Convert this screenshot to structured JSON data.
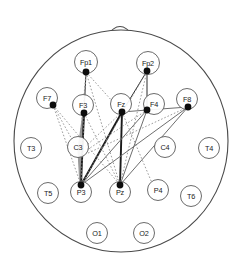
{
  "figure": {
    "view": "top-down head map with nose marker at top",
    "background_color": "#ffffff",
    "head": {
      "center_x": 121,
      "center_y": 141,
      "radius_x": 107,
      "radius_y": 111,
      "outline_color": "#4a4a4a"
    },
    "nose": {
      "name": "nose-marker",
      "apex_x": 120,
      "apex_y": 20,
      "base_left_x": 107,
      "base_left_y": 36,
      "base_right_x": 133,
      "base_right_y": 36
    }
  },
  "colors": {
    "outline": "#4a4a4a",
    "node_ring": "#5a5a5a",
    "node_dot": "#0d0d0d",
    "edge_strong": "#1a1a1a",
    "edge_medium": "#6e6e6e",
    "edge_weak": "#8a8a8a",
    "band": "#9a9a9a"
  },
  "electrodes": [
    {
      "id": "Fp1",
      "label": "Fp1",
      "x": 86,
      "y": 62,
      "r": 11.5,
      "active": true,
      "dot_x": 86,
      "dot_y": 72
    },
    {
      "id": "Fp2",
      "label": "Fp2",
      "x": 148,
      "y": 63,
      "r": 11.5,
      "active": true,
      "dot_x": 147,
      "dot_y": 71
    },
    {
      "id": "F7",
      "label": "F7",
      "x": 47,
      "y": 98,
      "r": 10.5,
      "active": true,
      "dot_x": 53,
      "dot_y": 105
    },
    {
      "id": "F3",
      "label": "F3",
      "x": 83,
      "y": 105,
      "r": 10.5,
      "active": true,
      "dot_x": 84,
      "dot_y": 113
    },
    {
      "id": "Fz",
      "label": "Fz",
      "x": 121,
      "y": 104,
      "r": 10.5,
      "active": true,
      "dot_x": 122,
      "dot_y": 112
    },
    {
      "id": "F4",
      "label": "F4",
      "x": 154,
      "y": 104,
      "r": 10.5,
      "active": true,
      "dot_x": 147,
      "dot_y": 110
    },
    {
      "id": "F8",
      "label": "F8",
      "x": 187,
      "y": 99,
      "r": 10.5,
      "active": true,
      "dot_x": 188,
      "dot_y": 107
    },
    {
      "id": "T3",
      "label": "T3",
      "x": 31,
      "y": 148,
      "r": 10.5,
      "active": false
    },
    {
      "id": "C3",
      "label": "C3",
      "x": 78,
      "y": 147,
      "r": 10.5,
      "active": false
    },
    {
      "id": "C4",
      "label": "C4",
      "x": 165,
      "y": 147,
      "r": 10.5,
      "active": false
    },
    {
      "id": "T4",
      "label": "T4",
      "x": 209,
      "y": 148,
      "r": 10.5,
      "active": false
    },
    {
      "id": "T5",
      "label": "T5",
      "x": 48,
      "y": 193,
      "r": 10.5,
      "active": false
    },
    {
      "id": "P3",
      "label": "P3",
      "x": 81,
      "y": 192,
      "r": 10.5,
      "active": true,
      "dot_x": 81,
      "dot_y": 185
    },
    {
      "id": "Pz",
      "label": "Pz",
      "x": 120,
      "y": 192,
      "r": 10.5,
      "active": true,
      "dot_x": 120,
      "dot_y": 185
    },
    {
      "id": "P4",
      "label": "P4",
      "x": 158,
      "y": 190,
      "r": 10.5,
      "active": false
    },
    {
      "id": "T6",
      "label": "T6",
      "x": 191,
      "y": 196,
      "r": 10.5,
      "active": false
    },
    {
      "id": "O1",
      "label": "O1",
      "x": 97,
      "y": 233,
      "r": 10.5,
      "active": false
    },
    {
      "id": "O2",
      "label": "O2",
      "x": 144,
      "y": 233,
      "r": 10.5,
      "active": false
    }
  ],
  "connections": [
    {
      "from": "F3",
      "to": "C3",
      "style": "band",
      "x1": 84,
      "y1": 113,
      "x2": 79,
      "y2": 150
    },
    {
      "from": "C3",
      "to": "P3",
      "style": "band",
      "x1": 79,
      "y1": 150,
      "x2": 81,
      "y2": 185
    },
    {
      "from": "F3",
      "to": "P3",
      "style": "solid-thick",
      "x1": 84,
      "y1": 113,
      "x2": 81,
      "y2": 185
    },
    {
      "from": "Fz",
      "to": "Pz",
      "style": "solid-thick",
      "x1": 122,
      "y1": 112,
      "x2": 120,
      "y2": 185
    },
    {
      "from": "Fz",
      "to": "P3",
      "style": "solid-thick",
      "x1": 122,
      "y1": 112,
      "x2": 81,
      "y2": 185
    },
    {
      "from": "Fp1",
      "to": "F3",
      "style": "solid-thin",
      "x1": 86,
      "y1": 72,
      "x2": 84,
      "y2": 113
    },
    {
      "from": "Fp1",
      "to": "Pz",
      "style": "dotted",
      "x1": 86,
      "y1": 72,
      "x2": 120,
      "y2": 185
    },
    {
      "from": "Fp1",
      "to": "P3",
      "style": "dotted",
      "x1": 86,
      "y1": 72,
      "x2": 81,
      "y2": 185
    },
    {
      "from": "Fp2",
      "to": "F4",
      "style": "solid-thin",
      "x1": 147,
      "y1": 71,
      "x2": 147,
      "y2": 110
    },
    {
      "from": "Fp2",
      "to": "Fz",
      "style": "solid-thin",
      "x1": 147,
      "y1": 71,
      "x2": 122,
      "y2": 112
    },
    {
      "from": "Fp2",
      "to": "Pz",
      "style": "dotted",
      "x1": 147,
      "y1": 71,
      "x2": 120,
      "y2": 185
    },
    {
      "from": "Fp2",
      "to": "P3",
      "style": "dotted",
      "x1": 147,
      "y1": 71,
      "x2": 81,
      "y2": 185
    },
    {
      "from": "F7",
      "to": "P3",
      "style": "dotted",
      "x1": 53,
      "y1": 105,
      "x2": 81,
      "y2": 185
    },
    {
      "from": "F7",
      "to": "Pz",
      "style": "dotted",
      "x1": 53,
      "y1": 105,
      "x2": 120,
      "y2": 185
    },
    {
      "from": "F7",
      "to": "C3",
      "style": "dotted",
      "x1": 53,
      "y1": 105,
      "x2": 74,
      "y2": 143
    },
    {
      "from": "F3",
      "to": "Pz",
      "style": "dotted",
      "x1": 84,
      "y1": 113,
      "x2": 120,
      "y2": 185
    },
    {
      "from": "Fz",
      "to": "C3",
      "style": "dotted",
      "x1": 122,
      "y1": 112,
      "x2": 82,
      "y2": 150
    },
    {
      "from": "F4",
      "to": "Pz",
      "style": "solid-gray",
      "x1": 147,
      "y1": 110,
      "x2": 120,
      "y2": 185
    },
    {
      "from": "F4",
      "to": "P3",
      "style": "solid-gray",
      "x1": 147,
      "y1": 110,
      "x2": 81,
      "y2": 185
    },
    {
      "from": "F8",
      "to": "Pz",
      "style": "solid-gray",
      "x1": 188,
      "y1": 107,
      "x2": 120,
      "y2": 185
    },
    {
      "from": "F8",
      "to": "P3",
      "style": "solid-gray",
      "x1": 188,
      "y1": 107,
      "x2": 81,
      "y2": 185
    },
    {
      "from": "F8",
      "to": "F4",
      "style": "solid-gray",
      "x1": 188,
      "y1": 107,
      "x2": 147,
      "y2": 110
    },
    {
      "from": "F4",
      "to": "Fz",
      "style": "solid-gray",
      "x1": 147,
      "y1": 110,
      "x2": 122,
      "y2": 112
    },
    {
      "from": "Fp1",
      "to": "Fz",
      "style": "dotted",
      "x1": 86,
      "y1": 72,
      "x2": 122,
      "y2": 112
    },
    {
      "from": "Fp1",
      "to": "C3",
      "style": "dotted",
      "x1": 86,
      "y1": 72,
      "x2": 80,
      "y2": 143
    },
    {
      "from": "Fz",
      "to": "P4",
      "style": "dotted",
      "x1": 122,
      "y1": 112,
      "x2": 152,
      "y2": 183
    },
    {
      "from": "F4",
      "to": "C3",
      "style": "dotted",
      "x1": 147,
      "y1": 110,
      "x2": 84,
      "y2": 152
    },
    {
      "from": "F8",
      "to": "C3",
      "style": "dotted",
      "x1": 188,
      "y1": 107,
      "x2": 86,
      "y2": 154
    }
  ]
}
